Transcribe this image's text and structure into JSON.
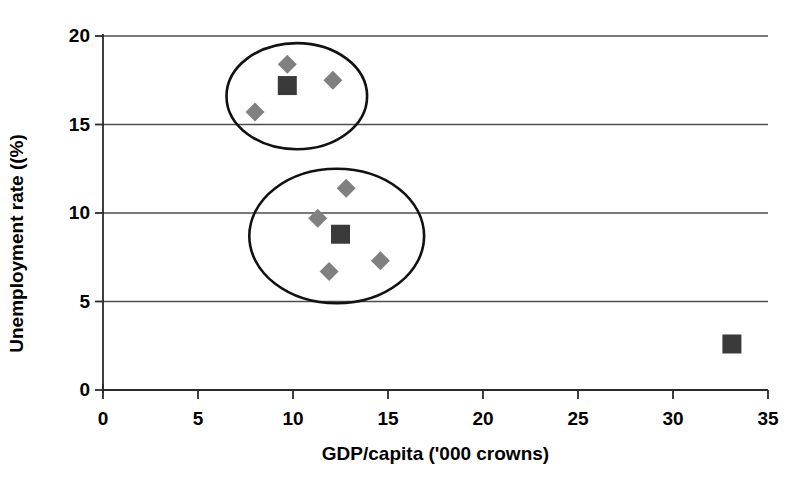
{
  "chart_data": {
    "type": "scatter",
    "title": "",
    "xlabel": "GDP/capita ('000 crowns)",
    "ylabel": "Unemployment rate ((%)",
    "xlim": [
      0,
      35
    ],
    "ylim": [
      0,
      20
    ],
    "xticks": [
      "0",
      "5",
      "10",
      "15",
      "20",
      "25",
      "30",
      "35"
    ],
    "yticks": [
      "0",
      "5",
      "10",
      "15",
      "20"
    ],
    "xtick_values": [
      0,
      5,
      10,
      15,
      20,
      25,
      30,
      35
    ],
    "ytick_values": [
      0,
      5,
      10,
      15,
      20
    ],
    "grid": "horizontal",
    "legend": "none",
    "series": [
      {
        "name": "diamond-series",
        "marker": "diamond",
        "color": "#808080",
        "points": [
          {
            "x": 9.7,
            "y": 18.4
          },
          {
            "x": 12.1,
            "y": 17.5
          },
          {
            "x": 8.0,
            "y": 15.7
          },
          {
            "x": 12.8,
            "y": 11.4
          },
          {
            "x": 11.3,
            "y": 9.7
          },
          {
            "x": 11.9,
            "y": 6.7
          },
          {
            "x": 14.6,
            "y": 7.3
          }
        ]
      },
      {
        "name": "square-series",
        "marker": "square",
        "color": "#3a3a3a",
        "points": [
          {
            "x": 9.7,
            "y": 17.2
          },
          {
            "x": 12.5,
            "y": 8.8
          },
          {
            "x": 33.1,
            "y": 2.6
          }
        ]
      }
    ],
    "annotations": [
      {
        "name": "upper-cluster-ellipse",
        "shape": "ellipse",
        "cx": 10.2,
        "cy": 16.6,
        "rx": 3.7,
        "ry": 3.0
      },
      {
        "name": "lower-cluster-ellipse",
        "shape": "ellipse",
        "cx": 12.3,
        "cy": 8.7,
        "rx": 4.6,
        "ry": 3.8
      }
    ]
  }
}
